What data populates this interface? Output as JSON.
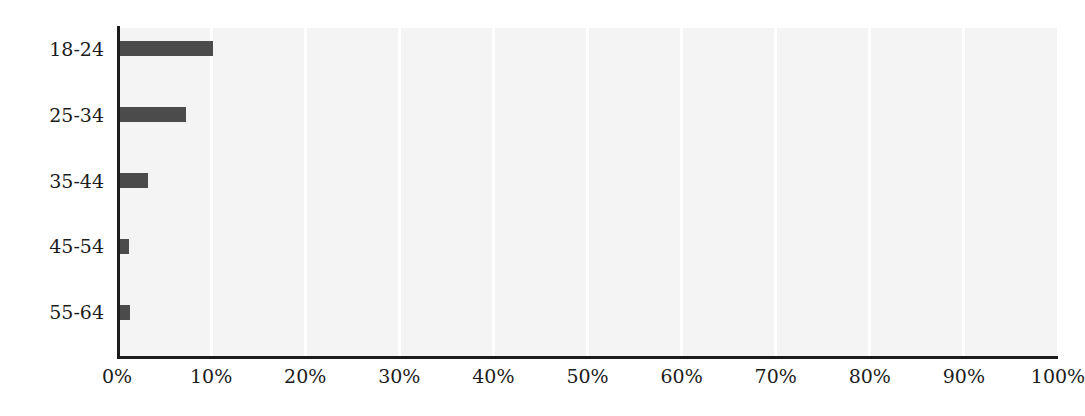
{
  "chart_data": {
    "type": "bar",
    "orientation": "horizontal",
    "title": "",
    "subtitle": "",
    "xlabel": "",
    "ylabel": "",
    "categories": [
      "18-24",
      "25-34",
      "35-44",
      "45-54",
      "55-64"
    ],
    "values": [
      10.2,
      7.3,
      3.3,
      1.3,
      1.4
    ],
    "value_suffix": "%",
    "xlim": [
      0,
      100
    ],
    "xticks": [
      0,
      10,
      20,
      30,
      40,
      50,
      60,
      70,
      80,
      90,
      100
    ],
    "xtick_labels": [
      "0%",
      "10%",
      "20%",
      "30%",
      "40%",
      "50%",
      "60%",
      "70%",
      "80%",
      "90%",
      "100%"
    ],
    "ytick_labels": [
      "18-24",
      "25-34",
      "35-44",
      "45-54",
      "55-64"
    ],
    "legend": [],
    "legend_position": "none",
    "grid": {
      "vertical": true,
      "horizontal": false,
      "color": "#ffffff"
    },
    "colors": {
      "bar": "#4b4b4b",
      "plot_background": "#f4f4f4",
      "figure_background": "#ffffff",
      "axis": "#1c1c1c",
      "tick_label": "#1c1c1c",
      "gridline": "#ffffff"
    },
    "series": [
      {
        "name": "",
        "values": [
          10.2,
          7.3,
          3.3,
          1.3,
          1.4
        ]
      }
    ]
  }
}
